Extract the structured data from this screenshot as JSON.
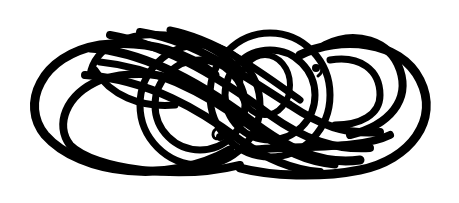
{
  "image": {
    "subject": "calligraphic flourish ornament",
    "background_color": "#ffffff",
    "ink_color": "#000000"
  }
}
